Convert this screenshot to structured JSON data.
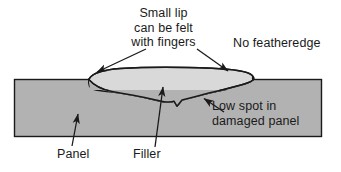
{
  "diagram": {
    "colors": {
      "panel_fill": "#b2b2b2",
      "filler_fill": "#d9d9d9",
      "outline": "#1a1a1a",
      "text": "#1a1a1a",
      "background": "#ffffff"
    },
    "labels": {
      "small_lip": "Small lip\ncan be felt\nwith fingers",
      "no_featheredge": "No featheredge",
      "low_spot": "Low spot in\ndamaged panel",
      "panel": "Panel",
      "filler": "Filler"
    },
    "shapes": {
      "panel": {
        "name": "panel-body",
        "x": 14,
        "y": 79,
        "width": 308,
        "height": 58
      },
      "filler": {
        "name": "filler-blob",
        "description": "light gray lens-shaped filler mound sitting above panel surface with low spot dipping below"
      }
    },
    "leaders": [
      {
        "name": "small-lip-left-arrow",
        "from": [
          146,
          49
        ],
        "to": [
          95,
          73
        ]
      },
      {
        "name": "small-lip-right-arrow",
        "from": [
          196,
          49
        ],
        "to": [
          229,
          72
        ]
      },
      {
        "name": "low-spot-arrow",
        "from": [
          224,
          112
        ],
        "to": [
          203,
          98
        ]
      },
      {
        "name": "panel-arrow",
        "from": [
          72,
          146
        ],
        "to": [
          78,
          115
        ]
      },
      {
        "name": "filler-arrow",
        "from": [
          155,
          147
        ],
        "to": [
          163,
          88
        ]
      }
    ]
  }
}
